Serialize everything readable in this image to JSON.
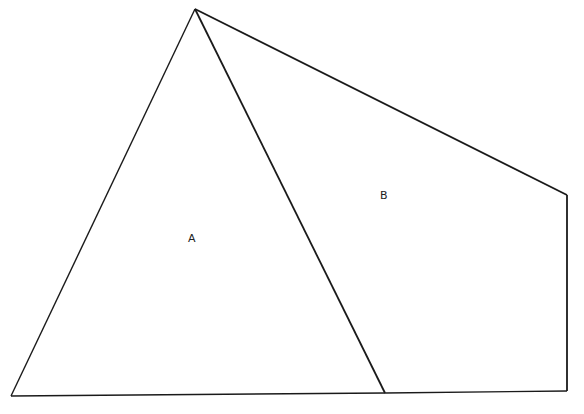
{
  "diagram": {
    "stroke_color": "#1a1a1a",
    "background": "#ffffff",
    "vertices": {
      "apex": [
        195,
        9
      ],
      "bottom_left": [
        11,
        396
      ],
      "bottom_middle": [
        385,
        393
      ],
      "bottom_right": [
        567,
        391
      ],
      "right_top": [
        567,
        195
      ]
    },
    "regions": [
      {
        "id": "A",
        "label": "A",
        "shape": "triangle",
        "position": [
          188,
          232
        ]
      },
      {
        "id": "B",
        "label": "B",
        "shape": "quadrilateral",
        "position": [
          380,
          189
        ]
      }
    ]
  }
}
